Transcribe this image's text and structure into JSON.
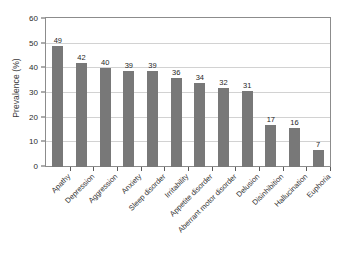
{
  "chart_data": {
    "type": "bar",
    "title": "",
    "xlabel": "",
    "ylabel": "Prevalence (%)",
    "ylim": [
      0,
      60
    ],
    "yticks": [
      0,
      10,
      20,
      30,
      40,
      50,
      60
    ],
    "grid": true,
    "legend": "none",
    "bar_color": "#787878",
    "categories": [
      "Apathy",
      "Depression",
      "Aggression",
      "Anxiety",
      "Sleep disorder",
      "Irritability",
      "Appetite disorder",
      "Aberrant motor disorder",
      "Delusion",
      "Disinhibition",
      "Hallucination",
      "Euphoria"
    ],
    "values": [
      49,
      42,
      40,
      39,
      39,
      36,
      34,
      32,
      31,
      17,
      16,
      7
    ],
    "value_labels": [
      "49",
      "42",
      "40",
      "39",
      "39",
      "36",
      "34",
      "32",
      "31",
      "17",
      "16",
      "7"
    ],
    "ytick_labels": [
      "0",
      "10",
      "20",
      "30",
      "40",
      "50",
      "60"
    ]
  }
}
